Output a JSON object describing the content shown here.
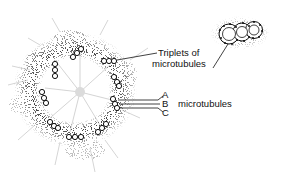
{
  "diagram": {
    "labels": {
      "triplets": [
        "Triplets of",
        "microtubules"
      ],
      "a": "A",
      "b": "B",
      "c": "C",
      "microtubules": "microtubules"
    },
    "triplet_count": 9,
    "colors": {
      "ink": "#111111",
      "stipple": "#555555",
      "background": "#ffffff"
    }
  }
}
